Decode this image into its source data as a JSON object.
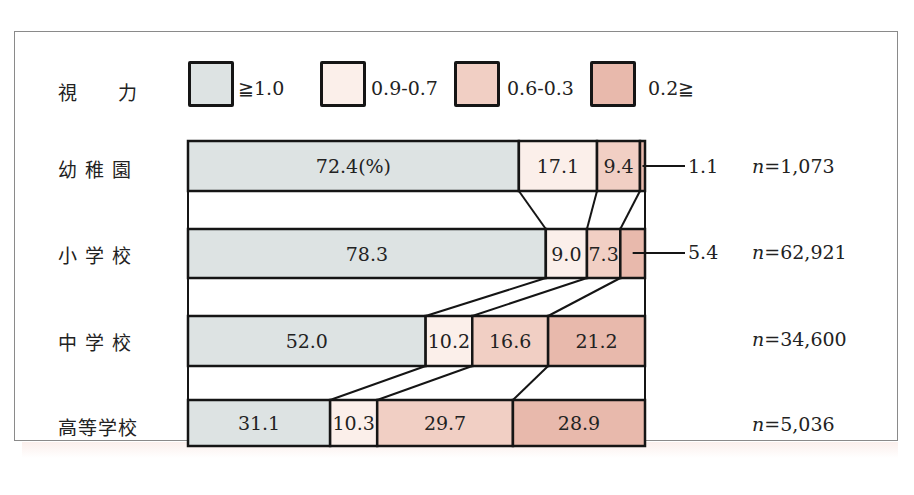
{
  "legend": {
    "title": "視　　力",
    "items": [
      {
        "label": "≧1.0",
        "color": "#dde3e3"
      },
      {
        "label": "0.9-0.7",
        "color": "#fbefea"
      },
      {
        "label": "0.6-0.3",
        "color": "#f1cfc4"
      },
      {
        "label": "0.2≧",
        "color": "#e8b9ac"
      }
    ]
  },
  "rows": [
    {
      "label": "幼 稚 園",
      "n_text": "n=1,073",
      "n_prefix": "n",
      "n_value": "=1,073",
      "callout": "1.1"
    },
    {
      "label": "小 学 校",
      "n_text": "n=62,921",
      "n_prefix": "n",
      "n_value": "=62,921",
      "callout": "5.4"
    },
    {
      "label": "中 学 校",
      "n_text": "n=34,600",
      "n_prefix": "n",
      "n_value": "=34,600",
      "callout": ""
    },
    {
      "label": "高等学校",
      "n_text": "n=5,036",
      "n_prefix": "n",
      "n_value": "=5,036",
      "callout": ""
    }
  ],
  "chart_data": {
    "type": "bar",
    "orientation": "horizontal",
    "stacked": true,
    "percent": true,
    "xlabel": "",
    "ylabel": "",
    "unit_annotation": "(%)",
    "categories": [
      "幼稚園",
      "小学校",
      "中学校",
      "高等学校"
    ],
    "sample_sizes": [
      1073,
      62921,
      34600,
      5036
    ],
    "series": [
      {
        "name": "≧1.0",
        "values": [
          72.4,
          78.3,
          52.0,
          31.1
        ],
        "color": "#dde3e3"
      },
      {
        "name": "0.9-0.7",
        "values": [
          17.1,
          9.0,
          10.2,
          10.3
        ],
        "color": "#fbefea"
      },
      {
        "name": "0.6-0.3",
        "values": [
          9.4,
          7.3,
          16.6,
          29.7
        ],
        "color": "#f1cfc4"
      },
      {
        "name": "0.2≧",
        "values": [
          1.1,
          5.4,
          21.2,
          28.9
        ],
        "color": "#e8b9ac"
      }
    ],
    "segment_labels": [
      [
        "72.4(%)",
        "17.1",
        "9.4",
        "1.1"
      ],
      [
        "78.3",
        "9.0",
        "7.3",
        "5.4"
      ],
      [
        "52.0",
        "10.2",
        "16.6",
        "21.2"
      ],
      [
        "31.1",
        "10.3",
        "29.7",
        "28.9"
      ]
    ],
    "connector_lines": true,
    "legend_position": "top",
    "grid": false,
    "xlim": [
      0,
      100
    ]
  }
}
